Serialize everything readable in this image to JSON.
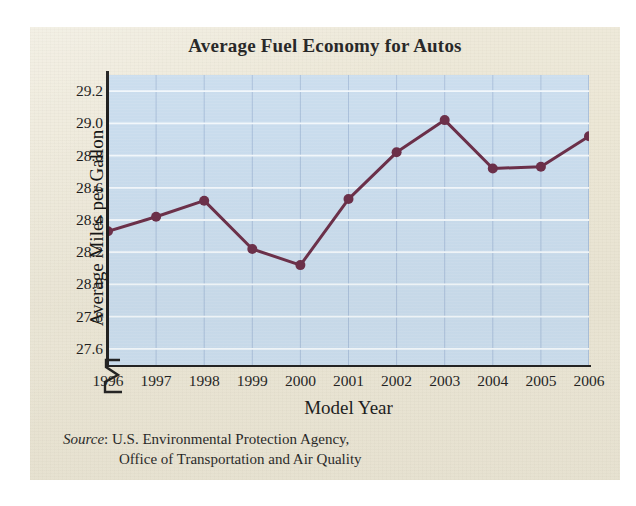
{
  "page": {
    "background_color": "#ece7d6",
    "outer_background": "#ffffff"
  },
  "chart_data": {
    "type": "line",
    "title": "Average Fuel Economy for Autos",
    "xlabel": "Model Year",
    "ylabel": "Average Miles per Gallon",
    "categories": [
      "1996",
      "1997",
      "1998",
      "1999",
      "2000",
      "2001",
      "2002",
      "2003",
      "2004",
      "2005",
      "2006"
    ],
    "values": [
      28.33,
      28.42,
      28.52,
      28.22,
      28.12,
      28.53,
      28.82,
      29.02,
      28.72,
      28.73,
      28.92
    ],
    "ylim": [
      27.5,
      29.3
    ],
    "y_ticks": [
      "29.2",
      "29.0",
      "28.8",
      "28.6",
      "28.4",
      "28.2",
      "28.0",
      "27.8",
      "27.6"
    ],
    "y_tick_values": [
      29.2,
      29.0,
      28.8,
      28.6,
      28.4,
      28.2,
      28.0,
      27.8,
      27.6
    ],
    "axis_break": true,
    "grid": true,
    "legend": "none",
    "series_color": "#6b2f49",
    "plot_background_color": "#c9dced",
    "gridline_color_horizontal": "#f2f7fb",
    "gridline_color_vertical": "#9fb6d4",
    "marker": "circle"
  },
  "source": {
    "label": "Source",
    "separator": ":",
    "line1": "U.S. Environmental Protection Agency,",
    "line2": "Office of Transportation and Air Quality"
  }
}
